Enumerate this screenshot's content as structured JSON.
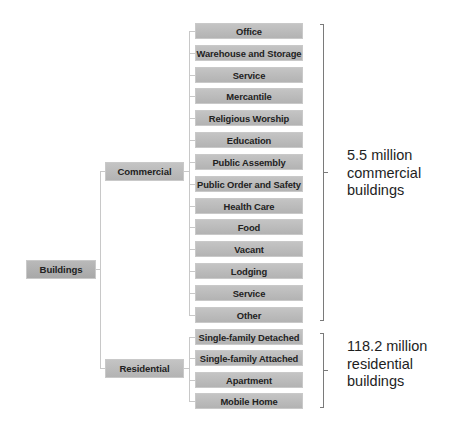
{
  "root": {
    "label": "Buildings"
  },
  "categories": [
    {
      "label": "Commercial",
      "summary": [
        "5.5 million",
        "commercial",
        "buildings"
      ],
      "children": [
        "Office",
        "Warehouse and Storage",
        "Service",
        "Mercantile",
        "Religious Worship",
        "Education",
        "Public Assembly",
        "Public Order and Safety",
        "Health Care",
        "Food",
        "Vacant",
        "Lodging",
        "Service",
        "Other"
      ]
    },
    {
      "label": "Residential",
      "summary": [
        "118.2 million",
        "residential",
        "buildings"
      ],
      "children": [
        "Single-family Detached",
        "Single-family Attached",
        "Apartment",
        "Mobile Home"
      ]
    }
  ],
  "colors": {
    "node_fill": "#bcbcbc",
    "connector": "#c8c8c8",
    "bracket": "#7a7a7a",
    "text": "#222222"
  }
}
